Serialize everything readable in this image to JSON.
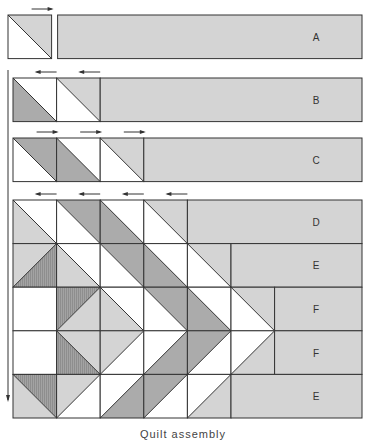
{
  "caption": "Quilt assembly",
  "colors": {
    "white": "#ffffff",
    "light": "#d4d4d4",
    "dark": "#ababab",
    "hatched": "#9a9a9a",
    "line": "#333333",
    "arrow": "#333333"
  },
  "square_size": 43.6,
  "rows": [
    {
      "label": "A",
      "y": 15,
      "x0": 8,
      "gap_after_squares": 6,
      "squares": [
        {
          "diag": "\\",
          "a": "light",
          "b": "white"
        }
      ],
      "press_arrows": [
        "right"
      ]
    },
    {
      "label": "B",
      "y": 78,
      "x0": 13,
      "squares": [
        {
          "diag": "\\",
          "a": "white",
          "b": "dark"
        },
        {
          "diag": "\\",
          "a": "light",
          "b": "white"
        }
      ],
      "press_arrows": [
        "left",
        "left"
      ]
    },
    {
      "label": "C",
      "y": 138,
      "x0": 13,
      "squares": [
        {
          "diag": "\\",
          "a": "dark",
          "b": "white"
        },
        {
          "diag": "\\",
          "a": "white",
          "b": "dark"
        },
        {
          "diag": "\\",
          "a": "light",
          "b": "white"
        }
      ],
      "press_arrows": [
        "right",
        "right",
        "right"
      ]
    },
    {
      "label": "D",
      "y": 200,
      "x0": 13,
      "squares": [
        {
          "diag": "\\",
          "a": "white",
          "b": "light"
        },
        {
          "diag": "\\",
          "a": "dark",
          "b": "white"
        },
        {
          "diag": "\\",
          "a": "white",
          "b": "dark"
        },
        {
          "diag": "\\",
          "a": "light",
          "b": "white"
        }
      ],
      "press_arrows": [
        "left",
        "left",
        "left",
        "left"
      ]
    },
    {
      "label": "E",
      "y": 243.6,
      "x0": 13,
      "squares": [
        {
          "diag": "/",
          "a": "light",
          "b": "hatched"
        },
        {
          "diag": "\\",
          "a": "white",
          "b": "light"
        },
        {
          "diag": "\\",
          "a": "dark",
          "b": "white"
        },
        {
          "diag": "\\",
          "a": "white",
          "b": "dark"
        },
        {
          "diag": "\\",
          "a": "light",
          "b": "white"
        }
      ],
      "press_arrows": []
    },
    {
      "label": "F",
      "y": 287.2,
      "x0": 13,
      "squares": [
        {
          "diag": "none",
          "a": "white",
          "b": "white"
        },
        {
          "diag": "/",
          "a": "hatched",
          "b": "light"
        },
        {
          "diag": "\\",
          "a": "white",
          "b": "light"
        },
        {
          "diag": "\\",
          "a": "dark",
          "b": "white"
        },
        {
          "diag": "\\",
          "a": "white",
          "b": "dark"
        },
        {
          "diag": "\\",
          "a": "light",
          "b": "white"
        }
      ],
      "press_arrows": []
    },
    {
      "label": "F",
      "y": 330.8,
      "x0": 13,
      "squares": [
        {
          "diag": "none",
          "a": "white",
          "b": "white"
        },
        {
          "diag": "\\",
          "a": "light",
          "b": "hatched"
        },
        {
          "diag": "/",
          "a": "light",
          "b": "white"
        },
        {
          "diag": "/",
          "a": "white",
          "b": "dark"
        },
        {
          "diag": "/",
          "a": "dark",
          "b": "white"
        },
        {
          "diag": "/",
          "a": "white",
          "b": "light"
        }
      ],
      "press_arrows": []
    },
    {
      "label": "E",
      "y": 374.4,
      "x0": 13,
      "squares": [
        {
          "diag": "\\",
          "a": "hatched",
          "b": "light"
        },
        {
          "diag": "/",
          "a": "light",
          "b": "white"
        },
        {
          "diag": "/",
          "a": "white",
          "b": "dark"
        },
        {
          "diag": "/",
          "a": "dark",
          "b": "white"
        },
        {
          "diag": "/",
          "a": "white",
          "b": "light"
        }
      ],
      "press_arrows": []
    }
  ],
  "rect_right_edge": 362,
  "vertical_arrow": {
    "x": 8,
    "y1": 70,
    "y2": 400,
    "direction": "down"
  }
}
